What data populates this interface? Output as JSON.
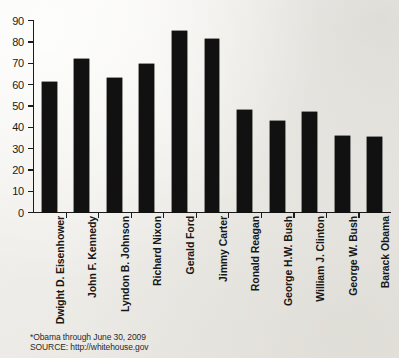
{
  "chart_data": {
    "type": "bar",
    "title": "",
    "subtitle": "",
    "xlabel": "",
    "ylabel": "",
    "ylim": [
      0,
      90
    ],
    "ytick_step": 10,
    "yticks": [
      90,
      80,
      70,
      60,
      50,
      40,
      30,
      20,
      10,
      0
    ],
    "grid": false,
    "legend": null,
    "bar_color": "#111111",
    "categories": [
      "Dwight D. Eisenhower",
      "John F. Kennedy",
      "Lyndon B. Johnson",
      "Richard Nixon",
      "Gerald Ford",
      "Jimmy Carter",
      "Ronald Reagan",
      "George H.W. Bush",
      "William J. Clinton",
      "George W. Bush",
      "Barack Obama"
    ],
    "values": [
      61,
      71.5,
      63,
      69.5,
      85,
      81,
      48,
      42.5,
      47,
      35.5,
      35
    ],
    "annotations": [
      "*Obama through June 30, 2009",
      "SOURCE: http://whitehouse.gov"
    ]
  },
  "footnote": {
    "line1": "*Obama through June 30, 2009",
    "line2": "SOURCE: http://whitehouse.gov"
  }
}
